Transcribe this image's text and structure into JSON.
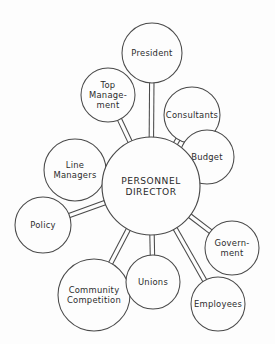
{
  "diagram": {
    "type": "hub-and-spoke",
    "background_color": "#fdfdfd",
    "stroke_color": "#4a4a4a",
    "text_color": "#2b2b2b",
    "hub": {
      "id": "personnel-director",
      "label_line1": "PERSONNEL",
      "label_line2": "DIRECTOR",
      "cx": 151,
      "cy": 186,
      "r": 49
    },
    "nodes": [
      {
        "id": "president",
        "label_line1": "President",
        "label_line2": "",
        "cx": 152,
        "cy": 53,
        "r": 30
      },
      {
        "id": "top-management",
        "label_line1": "Top",
        "label_line2": "Manage-",
        "label_line3": "ment",
        "cx": 108,
        "cy": 95,
        "r": 27
      },
      {
        "id": "consultants",
        "label_line1": "Consultants",
        "label_line2": "",
        "cx": 192,
        "cy": 115,
        "r": 28
      },
      {
        "id": "budget",
        "label_line1": "Budget",
        "label_line2": "",
        "cx": 207,
        "cy": 157,
        "r": 27
      },
      {
        "id": "line-managers",
        "label_line1": "Line",
        "label_line2": "Managers",
        "cx": 75,
        "cy": 170,
        "r": 31
      },
      {
        "id": "policy",
        "label_line1": "Policy",
        "label_line2": "",
        "cx": 43,
        "cy": 225,
        "r": 28
      },
      {
        "id": "community-competition",
        "label_line1": "Community",
        "label_line2": "Competition",
        "cx": 94,
        "cy": 295,
        "r": 36
      },
      {
        "id": "unions",
        "label_line1": "Unions",
        "label_line2": "",
        "cx": 153,
        "cy": 282,
        "r": 27
      },
      {
        "id": "government",
        "label_line1": "Govern-",
        "label_line2": "ment",
        "cx": 232,
        "cy": 248,
        "r": 27
      },
      {
        "id": "employees",
        "label_line1": "Employees",
        "label_line2": "",
        "cx": 218,
        "cy": 304,
        "r": 27
      }
    ],
    "connections": [
      {
        "from": "personnel-director",
        "to": "president"
      },
      {
        "from": "personnel-director",
        "to": "top-management"
      },
      {
        "from": "personnel-director",
        "to": "consultants"
      },
      {
        "from": "personnel-director",
        "to": "budget"
      },
      {
        "from": "personnel-director",
        "to": "line-managers"
      },
      {
        "from": "personnel-director",
        "to": "policy"
      },
      {
        "from": "personnel-director",
        "to": "community-competition"
      },
      {
        "from": "personnel-director",
        "to": "unions"
      },
      {
        "from": "personnel-director",
        "to": "government"
      },
      {
        "from": "personnel-director",
        "to": "employees"
      }
    ]
  }
}
